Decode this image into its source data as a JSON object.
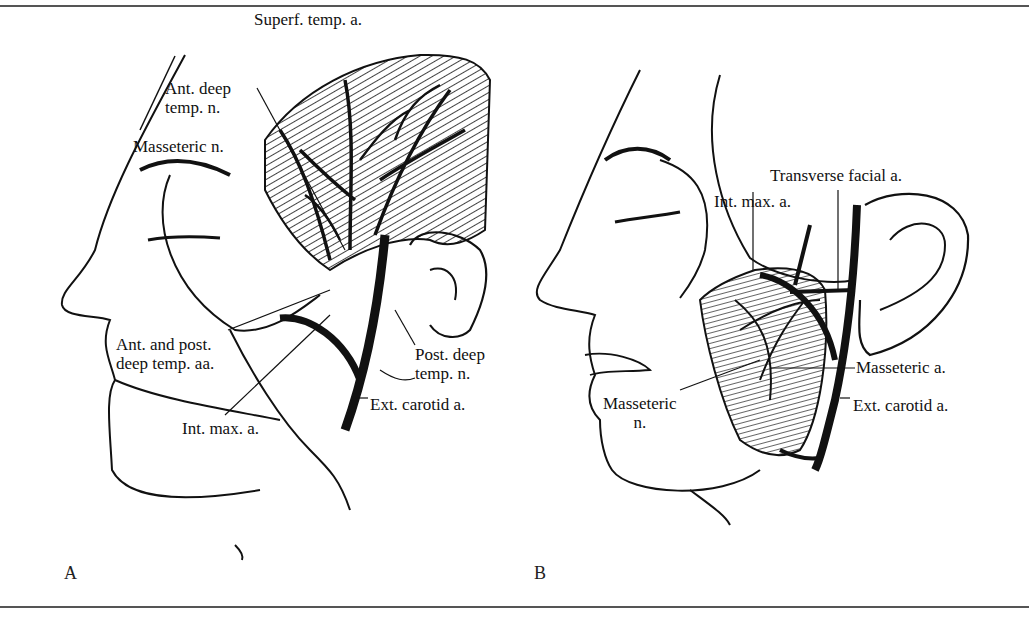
{
  "figure": {
    "panels": [
      {
        "id": "A",
        "letter": "A",
        "labels": {
          "superf_temp_a": "Superf. temp. a.",
          "ant_deep_temp_n_1": "Ant. deep",
          "ant_deep_temp_n_2": "temp. n.",
          "masseteric_n": "Masseteric n.",
          "ant_post_deep_temp_aa_1": "Ant. and post.",
          "ant_post_deep_temp_aa_2": "deep temp. aa.",
          "post_deep_temp_n_1": "Post. deep",
          "post_deep_temp_n_2": "temp. n.",
          "ext_carotid_a": "Ext. carotid a.",
          "int_max_a": "Int. max. a."
        }
      },
      {
        "id": "B",
        "letter": "B",
        "labels": {
          "transverse_facial_a": "Transverse facial a.",
          "int_max_a": "Int. max. a.",
          "masseteric_a": "Masseteric a.",
          "masseteric_n_1": "Masseteric",
          "masseteric_n_2": "n.",
          "ext_carotid_a": "Ext. carotid a."
        }
      }
    ],
    "colors": {
      "ink": "#111111",
      "rule": "#555555",
      "background": "#ffffff"
    }
  }
}
